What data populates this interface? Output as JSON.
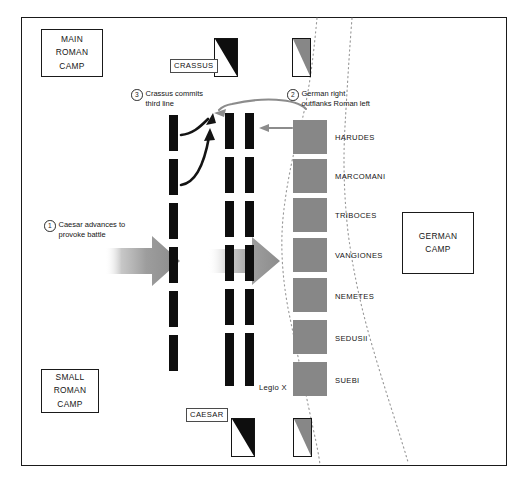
{
  "colors": {
    "roman_cohort": "#0e0e0e",
    "german_unit": "#878787",
    "border": "#1a1a1a",
    "arrow_gray": "#8c8c8c",
    "arrow_black": "#141414",
    "dotted_terrain": "#9a9a9a",
    "background": "#ffffff"
  },
  "camps": [
    {
      "id": "main-roman-camp",
      "lines": [
        "MAIN",
        "ROMAN",
        "CAMP"
      ]
    },
    {
      "id": "small-roman-camp",
      "lines": [
        "SMALL",
        "ROMAN",
        "CAMP"
      ]
    },
    {
      "id": "german-camp",
      "lines": [
        "GERMAN",
        "CAMP"
      ]
    }
  ],
  "commander_tags": [
    {
      "id": "crassus",
      "label": "CRASSUS"
    },
    {
      "id": "caesar",
      "label": "CAESAR"
    }
  ],
  "unit_labels": [
    {
      "id": "legio-x",
      "label": "Legio X"
    }
  ],
  "german_units": [
    {
      "name": "HARUDES"
    },
    {
      "name": "MARCOMANI"
    },
    {
      "name": "TRIBOCES"
    },
    {
      "name": "VANGIONES"
    },
    {
      "name": "NEMETES"
    },
    {
      "name": "SEDUSII"
    },
    {
      "name": "SUEBI"
    }
  ],
  "roman_lines": [
    {
      "id": "third-line",
      "cohort_count": 6
    },
    {
      "id": "second-line",
      "cohort_count": 6
    },
    {
      "id": "first-line",
      "cohort_count": 6
    }
  ],
  "annotations": [
    {
      "number": "1",
      "text": "Caesar advances to\nprovoke battle"
    },
    {
      "number": "2",
      "text": "German right\noutflanks Roman left"
    },
    {
      "number": "3",
      "text": "Crassus commits\nthird line"
    }
  ],
  "flags": [
    {
      "id": "crassus-cavalry-flag",
      "fill": "#0e0e0e",
      "orientation": "upper-right"
    },
    {
      "id": "german-left-cavalry-flag",
      "fill": "#878787",
      "orientation": "upper-right"
    },
    {
      "id": "caesar-cavalry-flag",
      "fill": "#0e0e0e",
      "orientation": "upper-right"
    },
    {
      "id": "german-right-cavalry-flag",
      "fill": "#878787",
      "orientation": "upper-right"
    }
  ]
}
